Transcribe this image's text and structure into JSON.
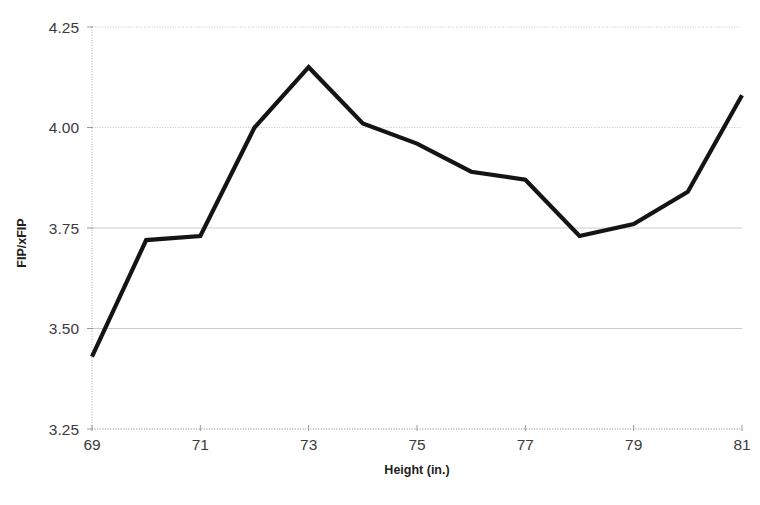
{
  "chart_data": {
    "type": "line",
    "title": "",
    "xlabel": "Height (in.)",
    "ylabel": "FIP/xFIP",
    "x": [
      69,
      70,
      71,
      72,
      73,
      74,
      75,
      76,
      77,
      78,
      79,
      80,
      81
    ],
    "values": [
      3.43,
      3.72,
      3.73,
      4.0,
      4.15,
      4.01,
      3.96,
      3.89,
      3.87,
      3.73,
      3.76,
      3.84,
      4.08
    ],
    "series": [
      {
        "name": "FIP/xFIP",
        "values": [
          3.43,
          3.72,
          3.73,
          4.0,
          4.15,
          4.01,
          3.96,
          3.89,
          3.87,
          3.73,
          3.76,
          3.84,
          4.08
        ],
        "color": "#141414"
      }
    ],
    "xlim": [
      69,
      81
    ],
    "ylim": [
      3.25,
      4.25
    ],
    "xticks": [
      69,
      71,
      73,
      75,
      77,
      79,
      81
    ],
    "xtick_labels": [
      "69",
      "71",
      "73",
      "75",
      "77",
      "79",
      "81"
    ],
    "yticks": [
      3.25,
      3.5,
      3.75,
      4.0,
      4.25
    ],
    "ytick_labels": [
      "3.25",
      "3.50",
      "3.75",
      "4.00",
      "4.25"
    ],
    "grid": true,
    "legend": false,
    "legend_position": "none"
  },
  "axes": {
    "y_axis_title": "FIP/xFIP",
    "x_axis_title": "Height (in.)"
  }
}
